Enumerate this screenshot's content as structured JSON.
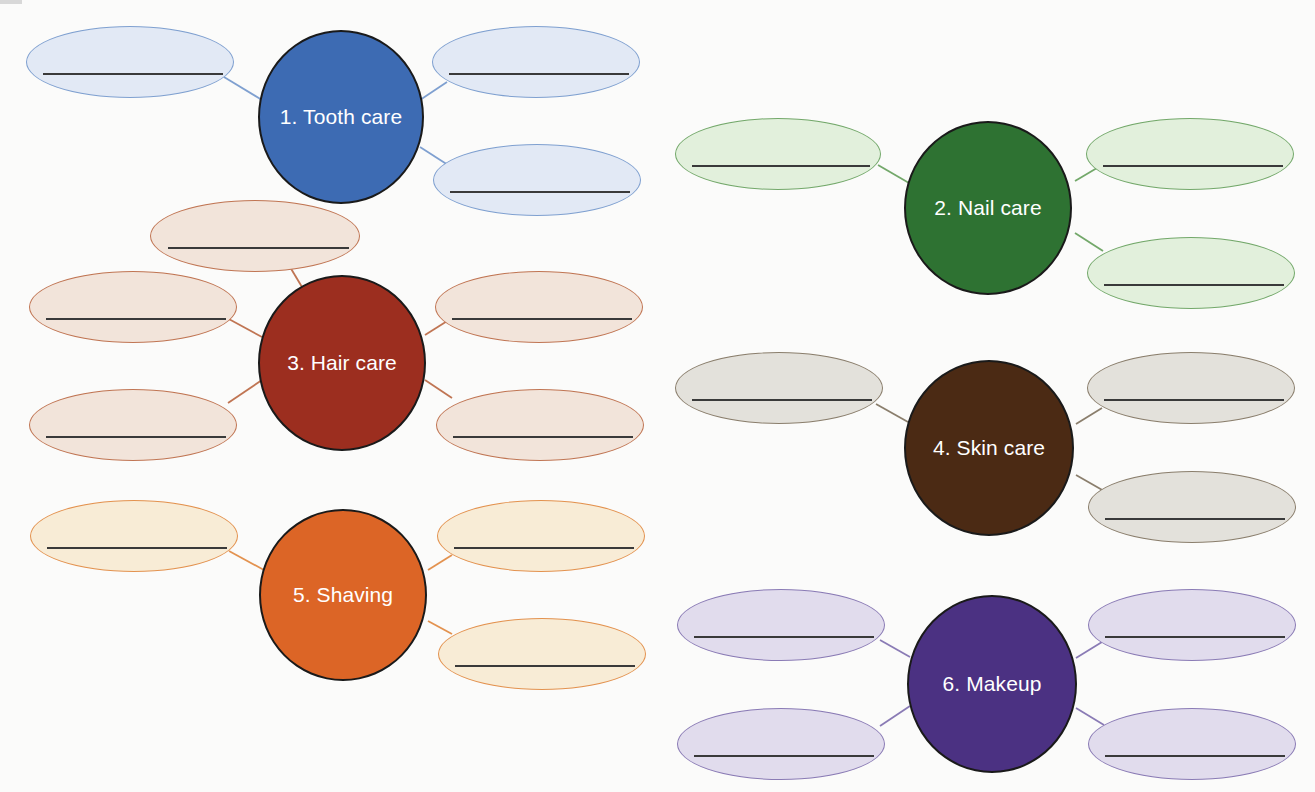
{
  "diagram": {
    "type": "concept-map worksheet",
    "clusters": [
      {
        "id": "tooth-care",
        "label": "1. Tooth care",
        "hub_color": "#3d6bb3",
        "bubble_fill": "#e2e9f5",
        "bubble_border": "#7fa0d0",
        "blank_count": 3,
        "blanks": [
          "",
          "",
          ""
        ]
      },
      {
        "id": "nail-care",
        "label": "2. Nail care",
        "hub_color": "#2e7232",
        "bubble_fill": "#e2f0dc",
        "bubble_border": "#73a86a",
        "blank_count": 3,
        "blanks": [
          "",
          "",
          ""
        ]
      },
      {
        "id": "hair-care",
        "label": "3. Hair care",
        "hub_color": "#9c2e1f",
        "bubble_fill": "#f2e4da",
        "bubble_border": "#c07553",
        "blank_count": 5,
        "blanks": [
          "",
          "",
          "",
          "",
          ""
        ]
      },
      {
        "id": "skin-care",
        "label": "4. Skin care",
        "hub_color": "#4b2a14",
        "bubble_fill": "#e3e1db",
        "bubble_border": "#8a7e6c",
        "blank_count": 3,
        "blanks": [
          "",
          "",
          ""
        ]
      },
      {
        "id": "shaving",
        "label": "5. Shaving",
        "hub_color": "#dc6526",
        "bubble_fill": "#f8ecd6",
        "bubble_border": "#e3924f",
        "blank_count": 3,
        "blanks": [
          "",
          "",
          ""
        ]
      },
      {
        "id": "makeup",
        "label": "6. Makeup",
        "hub_color": "#4b3182",
        "bubble_fill": "#e1dced",
        "bubble_border": "#8a7bb5",
        "blank_count": 4,
        "blanks": [
          "",
          "",
          "",
          ""
        ]
      }
    ]
  }
}
